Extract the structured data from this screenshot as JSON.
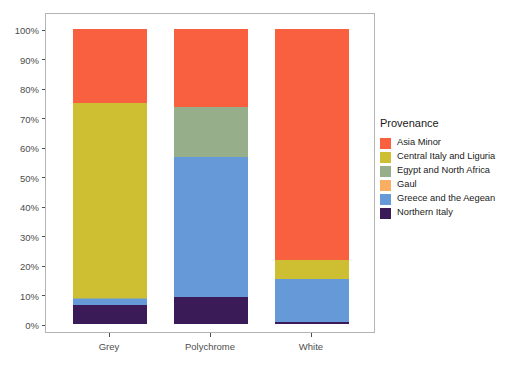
{
  "chart_data": {
    "type": "bar",
    "stacked": true,
    "stack_mode": "percent",
    "title": "",
    "xlabel": "",
    "ylabel": "",
    "categories": [
      "Grey",
      "Polychrome",
      "White"
    ],
    "ylim": [
      0,
      100
    ],
    "ytick_labels": [
      "0%",
      "10%",
      "20%",
      "30%",
      "40%",
      "50%",
      "60%",
      "70%",
      "80%",
      "90%",
      "100%"
    ],
    "ytick_values": [
      0,
      10,
      20,
      30,
      40,
      50,
      60,
      70,
      80,
      90,
      100
    ],
    "grid": false,
    "legend_position": "right",
    "legend_title": "Provenance",
    "series": [
      {
        "name": "Asia Minor",
        "color": "#F8603F",
        "values": [
          25.0,
          26.4,
          78.3
        ]
      },
      {
        "name": "Central Italy and Liguria",
        "color": "#CDBE32",
        "values": [
          66.1,
          0.0,
          6.4
        ]
      },
      {
        "name": "Egypt and North Africa",
        "color": "#96AE8A",
        "values": [
          0.5,
          17.0,
          0.0
        ]
      },
      {
        "name": "Gaul",
        "color": "#FAAE61",
        "values": [
          0.0,
          0.0,
          0.0
        ]
      },
      {
        "name": "Greece and the Aegean",
        "color": "#6699D8",
        "values": [
          2.0,
          47.3,
          14.5
        ]
      },
      {
        "name": "Northern Italy",
        "color": "#3B1A58",
        "values": [
          6.4,
          9.3,
          0.8
        ]
      }
    ]
  },
  "legend": {
    "title": "Provenance",
    "items": [
      {
        "label": "Asia Minor",
        "color": "#F8603F"
      },
      {
        "label": "Central Italy and Liguria",
        "color": "#CDBE32"
      },
      {
        "label": "Egypt and North Africa",
        "color": "#96AE8A"
      },
      {
        "label": "Gaul",
        "color": "#FAAE61"
      },
      {
        "label": "Greece and the Aegean",
        "color": "#6699D8"
      },
      {
        "label": "Northern Italy",
        "color": "#3B1A58"
      }
    ]
  },
  "axis": {
    "y_labels": [
      "100%",
      "90%",
      "80%",
      "70%",
      "60%",
      "50%",
      "40%",
      "30%",
      "20%",
      "10%",
      "0%"
    ],
    "x_labels": [
      "Grey",
      "Polychrome",
      "White"
    ]
  },
  "colors": {
    "panel_border": "#b4b4b4",
    "axis_text": "#4d4d4d",
    "background": "#ffffff"
  }
}
